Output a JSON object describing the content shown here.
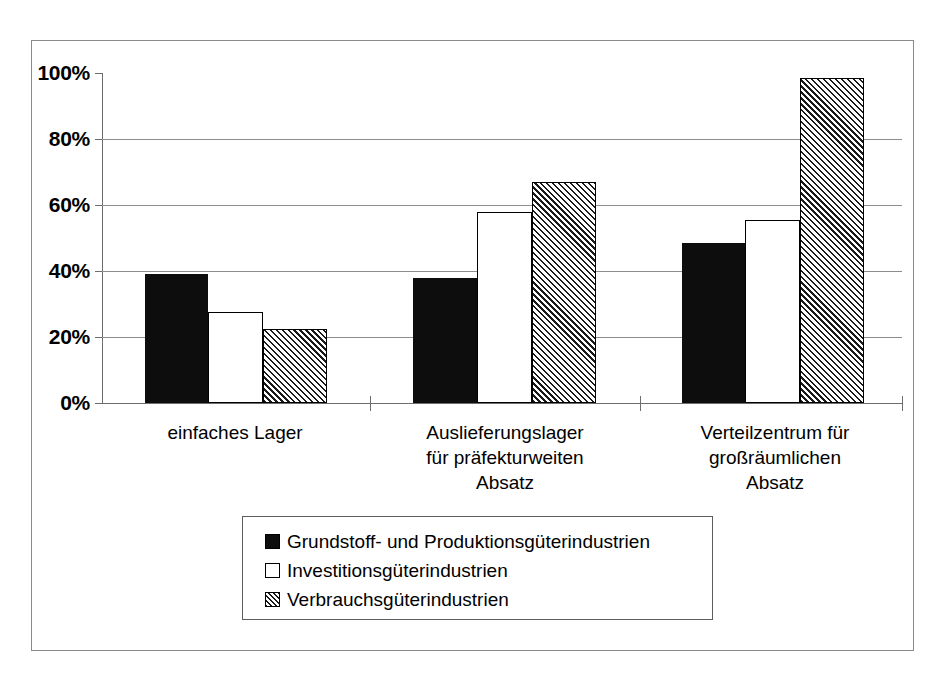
{
  "chart_data": {
    "type": "bar",
    "title": "",
    "xlabel": "",
    "ylabel": "",
    "ylim": [
      0,
      100
    ],
    "grid": true,
    "legend_position": "bottom-center",
    "ytick_labels": [
      "100%",
      "80%",
      "60%",
      "40%",
      "20%",
      "0%"
    ],
    "ytick_values": [
      100,
      80,
      60,
      40,
      20,
      0
    ],
    "categories": [
      "einfaches Lager",
      "Auslieferungslager\nfür präfekturweiten\nAbsatz",
      "Verteilzentrum für\ngroßräumlichen\nAbsatz"
    ],
    "series": [
      {
        "name": "Grundstoff- und Produktionsgüterindustrien",
        "fill": "solid",
        "color": "#0d0d0d",
        "values": [
          39,
          38,
          48.5
        ]
      },
      {
        "name": "Investitionsgüterindustrien",
        "fill": "open",
        "color": "#ffffff",
        "values": [
          27.5,
          58,
          55.5
        ]
      },
      {
        "name": "Verbrauchsgüterindustrien",
        "fill": "hatched",
        "color": "#ffffff",
        "values": [
          22.5,
          67,
          98.5
        ]
      }
    ]
  },
  "legend": {
    "items": [
      {
        "label": "Grundstoff- und Produktionsgüterindustrien",
        "fill": "solid"
      },
      {
        "label": "Investitionsgüterindustrien",
        "fill": "open"
      },
      {
        "label": "Verbrauchsgüterindustrien",
        "fill": "hatched"
      }
    ]
  }
}
